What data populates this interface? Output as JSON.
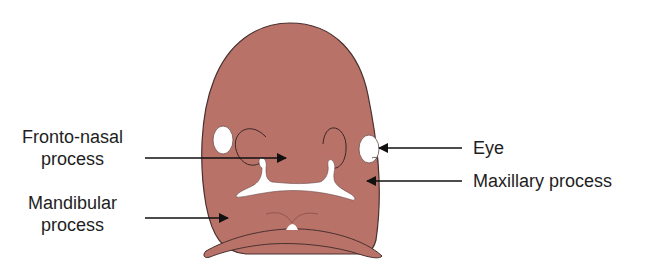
{
  "diagram": {
    "colors": {
      "tissue": "#b87268",
      "tissue_outline": "#4a3030",
      "cavity": "#ffffff",
      "arrow": "#111111",
      "text": "#1e1e1e"
    },
    "labels": {
      "fronto_nasal": {
        "line1": "Fronto-nasal",
        "line2": "process"
      },
      "mandibular": {
        "line1": "Mandibular",
        "line2": "process"
      },
      "eye": {
        "text": "Eye"
      },
      "maxillary": {
        "text": "Maxillary process"
      }
    }
  }
}
